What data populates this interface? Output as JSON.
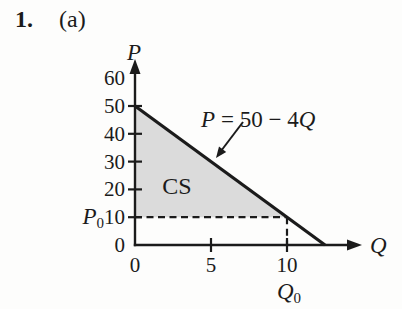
{
  "page": {
    "problem_number": "1.",
    "part_label": "(a)"
  },
  "chart_data": {
    "type": "line",
    "title": "",
    "xlabel": "Q",
    "ylabel": "P",
    "x_ticks": [
      0,
      5,
      10
    ],
    "y_ticks": [
      0,
      10,
      20,
      30,
      40,
      50,
      60
    ],
    "xlim": [
      0,
      15
    ],
    "ylim": [
      0,
      63
    ],
    "grid": false,
    "legend": "none",
    "series": [
      {
        "name": "demand-line",
        "label_parts": {
          "var_left": "P",
          "middle": "= 50 − 4",
          "var_right": "Q"
        },
        "points": [
          [
            0,
            50
          ],
          [
            12.5,
            0
          ]
        ]
      }
    ],
    "shaded_region": {
      "label": "CS",
      "vertices": [
        [
          0,
          50
        ],
        [
          0,
          10
        ],
        [
          10,
          10
        ]
      ]
    },
    "reference_lines": [
      {
        "name": "price-dashed-line",
        "from": [
          0,
          10
        ],
        "to": [
          10,
          10
        ],
        "style": "dashed"
      },
      {
        "name": "quantity-dashed-line",
        "from": [
          10,
          10
        ],
        "to": [
          10,
          0
        ],
        "style": "dashed"
      }
    ],
    "axis_annotations": {
      "p0": {
        "base": "P",
        "sub": "0",
        "value": 10
      },
      "q0": {
        "base": "Q",
        "sub": "0",
        "value": 10
      }
    },
    "colors": {
      "ink": "#1b1b1b",
      "shade": "#dbdbdb"
    }
  }
}
